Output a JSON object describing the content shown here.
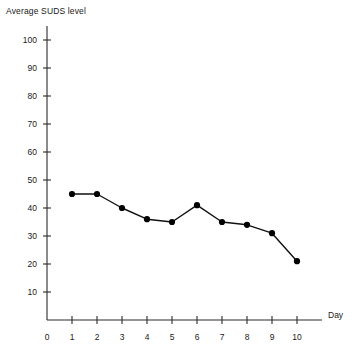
{
  "chart_data": {
    "type": "line",
    "title": "",
    "ylabel": "Average SUDS level",
    "xlabel": "Day",
    "x": [
      1,
      2,
      3,
      4,
      5,
      6,
      7,
      8,
      9,
      10
    ],
    "values": [
      45,
      45,
      40,
      36,
      35,
      41,
      35,
      34,
      31,
      21
    ],
    "series": [
      {
        "name": "Average SUDS level",
        "values": [
          45,
          45,
          40,
          36,
          35,
          41,
          35,
          34,
          31,
          21
        ]
      }
    ],
    "xlim": [
      0,
      10
    ],
    "ylim": [
      0,
      105
    ],
    "x_tick_labels": [
      "0",
      "1",
      "2",
      "3",
      "4",
      "5",
      "6",
      "7",
      "8",
      "9",
      "10"
    ],
    "y_tick_labels": [
      "10",
      "20",
      "30",
      "40",
      "50",
      "60",
      "70",
      "80",
      "90",
      "100"
    ],
    "y_ticks": [
      10,
      20,
      30,
      40,
      50,
      60,
      70,
      80,
      90,
      100
    ],
    "x_ticks": [
      0,
      1,
      2,
      3,
      4,
      5,
      6,
      7,
      8,
      9,
      10
    ],
    "grid": false,
    "legend": "none",
    "marker": "filled-circle",
    "line_color": "#111111",
    "marker_color": "#000000",
    "axis_color": "#2b2b2b",
    "background_color": "#ffffff"
  }
}
